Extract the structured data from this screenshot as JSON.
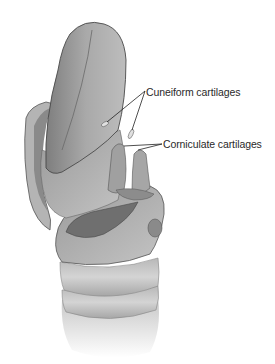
{
  "figure": {
    "style": "grayscale pencil illustration",
    "colors": {
      "background": "#ffffff",
      "tissue_light": "#d6d6d6",
      "tissue_mid": "#a8a8a8",
      "tissue_dark": "#6e6e6e",
      "outline": "#4a4a4a",
      "label_text": "#2a2a2a"
    }
  },
  "labels": [
    {
      "id": "cuneiform",
      "text": "Cuneiform cartilages",
      "pointers": 2
    },
    {
      "id": "corniculate",
      "text": "Corniculate cartilages",
      "pointers": 2
    }
  ]
}
